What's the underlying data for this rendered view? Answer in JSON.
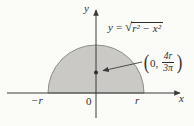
{
  "figure": {
    "equation": {
      "lhs": "y",
      "equals": "=",
      "radical_sign": "√",
      "radicand": "r² − x²"
    },
    "point_label": {
      "open_paren": "(",
      "x_coord": "0,",
      "numerator": "4r",
      "denominator": "3π",
      "close_paren": ")"
    },
    "axis_labels": {
      "y": "y",
      "x": "x",
      "neg_r": "−r",
      "origin": "0",
      "r": "r"
    },
    "colors": {
      "bg": "#fbfbf8",
      "fill": "#cac9c5",
      "outline": "#8e8e8a",
      "axis": "#3b3b3b",
      "ink": "#2f2f2f"
    }
  }
}
